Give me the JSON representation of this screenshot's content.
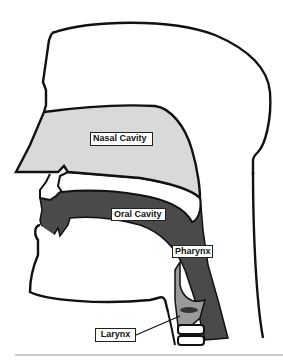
{
  "diagram": {
    "type": "anatomical-cross-section",
    "labels": [
      {
        "id": "nasal",
        "text": "Nasal Cavity"
      },
      {
        "id": "oral",
        "text": "Oral Cavity"
      },
      {
        "id": "pharynx",
        "text": "Pharynx"
      },
      {
        "id": "larynx",
        "text": "Larynx"
      }
    ],
    "colors": {
      "outline": "#111111",
      "nasal_fill": "#d9d9d9",
      "oral_fill": "#4a4a4a",
      "larynx_fill": "#9a9a9a",
      "background": "#ffffff",
      "baseline": "#999999"
    }
  }
}
